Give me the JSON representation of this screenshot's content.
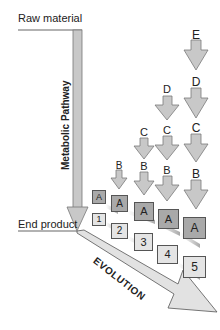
{
  "labels": {
    "raw_material": "Raw material",
    "end_product": "End product",
    "pathway": "Metabolic Pathway",
    "evolution": "EVOLUTION"
  },
  "columns": [
    {
      "stage": 1,
      "enzyme": "A",
      "product": "1",
      "steps": []
    },
    {
      "stage": 2,
      "enzyme": "A",
      "product": "2",
      "steps": [
        "B"
      ]
    },
    {
      "stage": 3,
      "enzyme": "A",
      "product": "3",
      "steps": [
        "C",
        "B"
      ]
    },
    {
      "stage": 4,
      "enzyme": "A",
      "product": "4",
      "steps": [
        "D",
        "C",
        "B"
      ]
    },
    {
      "stage": 5,
      "enzyme": "A",
      "product": "5",
      "steps": [
        "E",
        "D",
        "C",
        "B"
      ]
    }
  ],
  "colors": {
    "arrow_fill": "#c8c8c8",
    "arrow_stroke": "#7a7a7a",
    "enzyme_box": "#a9a9a9",
    "product_box": "#e4e4e4"
  }
}
